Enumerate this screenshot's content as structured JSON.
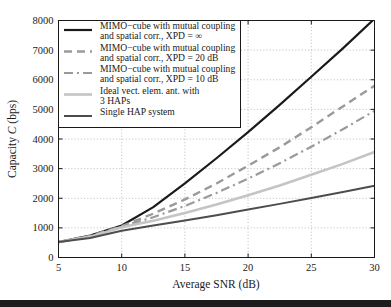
{
  "chart_data": {
    "type": "line",
    "title": "",
    "xlabel": "Average SNR (dB)",
    "ylabel_prefix": "Capacity ",
    "ylabel_italic": "C",
    "ylabel_suffix": " (bps)",
    "ylabel_full": "Capacity C (bps)",
    "xlim": [
      5,
      30
    ],
    "ylim": [
      0,
      8000
    ],
    "xticks": [
      5,
      10,
      15,
      20,
      25,
      30
    ],
    "yticks": [
      0,
      1000,
      2000,
      3000,
      4000,
      5000,
      6000,
      7000,
      8000
    ],
    "xtick_labels": [
      "5",
      "10",
      "15",
      "20",
      "25",
      "30"
    ],
    "ytick_labels": [
      "0",
      "1000",
      "2000",
      "3000",
      "4000",
      "5000",
      "6000",
      "7000",
      "8000"
    ],
    "grid": true,
    "grid_style": "dotted",
    "legend_position": "upper left",
    "x": [
      5,
      7.5,
      10,
      12.5,
      15,
      17.5,
      20,
      22.5,
      25,
      27.5,
      30
    ],
    "series": [
      {
        "name": "MIMO-cube with mutual coupling and spatial corr., XPD = inf",
        "label_line1": "MIMO−cube with mutual coupling",
        "label_line2": "and spatial corr., XPD = ∞",
        "color": "#1a1a1a",
        "dash": "none",
        "width": 2.2,
        "values": [
          520,
          740,
          1080,
          1700,
          2500,
          3350,
          4230,
          5150,
          6100,
          7060,
          8060
        ]
      },
      {
        "name": "MIMO-cube with mutual coupling and spatial corr., XPD = 20 dB",
        "label_line1": "MIMO−cube with mutual coupling",
        "label_line2": "and spatial corr., XPD = 20 dB",
        "color": "#9a9a9a",
        "dash": "8,5",
        "width": 2.4,
        "values": [
          520,
          730,
          1060,
          1480,
          1960,
          2500,
          3100,
          3720,
          4400,
          5100,
          5800
        ]
      },
      {
        "name": "MIMO-cube with mutual coupling and spatial corr., XPD = 10 dB",
        "label_line1": "MIMO−cube with mutual coupling",
        "label_line2": "and spatial corr., XPD = 10 dB",
        "color": "#9a9a9a",
        "dash": "9,4,2,4",
        "width": 2.2,
        "values": [
          520,
          720,
          1040,
          1360,
          1740,
          2180,
          2660,
          3180,
          3740,
          4330,
          4950
        ]
      },
      {
        "name": "Ideal vect. elem. ant. with 3 HAPs",
        "label_line1": "Ideal vect. elem. ant. with",
        "label_line2": "3 HAPs",
        "color": "#c4c4c4",
        "dash": "none",
        "width": 2.6,
        "values": [
          520,
          700,
          1020,
          1240,
          1500,
          1790,
          2100,
          2430,
          2790,
          3160,
          3560
        ]
      },
      {
        "name": "Single HAP system",
        "label_line1": "Single HAP system",
        "label_line2": "",
        "color": "#4d4d4d",
        "dash": "none",
        "width": 2.0,
        "values": [
          520,
          660,
          900,
          1080,
          1250,
          1430,
          1620,
          1810,
          2010,
          2210,
          2420
        ]
      }
    ]
  },
  "legend": {
    "entries": [
      {
        "line1": "MIMO−cube with mutual coupling",
        "line2": "and spatial corr., XPD = ∞"
      },
      {
        "line1": "MIMO−cube with mutual coupling",
        "line2": "and spatial corr., XPD = 20 dB"
      },
      {
        "line1": "MIMO−cube with mutual coupling",
        "line2": "and spatial corr., XPD = 10 dB"
      },
      {
        "line1": "Ideal vect. elem. ant. with",
        "line2": "3 HAPs"
      },
      {
        "line1": "Single HAP system",
        "line2": ""
      }
    ]
  },
  "colors": {
    "axis": "#1a1a1a",
    "grid": "#9e9e9e",
    "background": "#ffffff",
    "footer_bar": "#1c1c1c"
  }
}
